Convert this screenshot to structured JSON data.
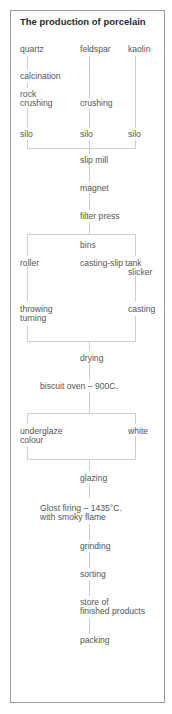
{
  "title": "The production of porcelain",
  "nodes": {
    "quartz": "quartz",
    "feldspar": "feldspar",
    "kaolin": "kaolin",
    "calcination": "calcination",
    "rock_crushing_1": "rock",
    "rock_crushing_2": "crushing",
    "crushing": "crushing",
    "silo_left": "silo",
    "silo_mid": "silo",
    "silo_right": "silo",
    "slip_mill": "slip mill",
    "magnet": "magnet",
    "filter_press": "filter press",
    "bins": "bins",
    "roller": "roller",
    "casting_slip_tank": "casting-slip tank",
    "slicker": "slicker",
    "throwing": "throwing",
    "turning": "turning",
    "casting": "casting",
    "drying": "drying",
    "biscuit_oven": "biscuit oven – 900C.",
    "underglaze": "underglaze",
    "colour": "colour",
    "white": "white",
    "glazing": "glazing",
    "glost_firing_1": "Glost firing – 1435°C.",
    "glost_firing_2": "with smoky flame",
    "grinding": "grinding",
    "sorting": "sorting",
    "store_1": "store of",
    "store_2": "finished products",
    "packing": "packing"
  }
}
